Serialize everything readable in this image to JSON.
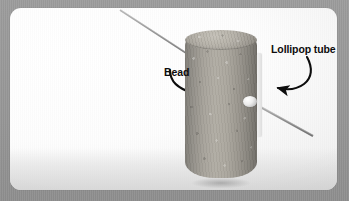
{
  "figure": {
    "kind": "photograph-diagram",
    "frame_color": "#9a9a9a",
    "card_color": "#ffffff",
    "label_color": "#0d0d0d",
    "cork_color": "#a6a29a",
    "tube_color": "#f7f7f7",
    "bead_color": "#ededed",
    "rod_color": "#8c8c8c"
  },
  "annotations": [
    {
      "id": "bead",
      "label": "Bead",
      "arrow": "curved-arrow-right",
      "points_to": "small white bead on the side of the cork"
    },
    {
      "id": "lollipop-tube",
      "label": "Lollipop tube",
      "arrow": "curved-arrow-left-down",
      "points_to": "white plastic tube strip on right of cork"
    }
  ],
  "icons": {
    "bead_arrow": "curved-arrow-icon",
    "tube_arrow": "curved-arrow-icon"
  }
}
